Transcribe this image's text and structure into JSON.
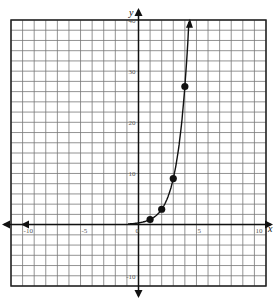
{
  "chart_data": {
    "type": "scatter",
    "title": "",
    "xlabel": "x",
    "ylabel": "y",
    "xlim": [
      -11,
      11
    ],
    "ylim": [
      -12,
      40
    ],
    "x_grid_step": 1,
    "y_grid_step": 2,
    "grid": true,
    "x_tick_labels": [
      "-10",
      "-5",
      "0",
      "5",
      "10"
    ],
    "x_tick_values": [
      -10,
      -5,
      0,
      5,
      10
    ],
    "y_tick_labels": [
      "40",
      "30",
      "20",
      "10",
      "-10"
    ],
    "y_tick_values": [
      40,
      30,
      20,
      10,
      -10
    ],
    "series": [
      {
        "name": "points",
        "x": [
          1,
          2,
          3,
          4
        ],
        "y": [
          1,
          3,
          9,
          27
        ],
        "marker": "filled-circle"
      },
      {
        "name": "curve",
        "function": "y = 3^(x-1)",
        "style": "line-with-arrow"
      }
    ]
  },
  "labels": {
    "x_axis": "x",
    "y_axis": "y"
  }
}
